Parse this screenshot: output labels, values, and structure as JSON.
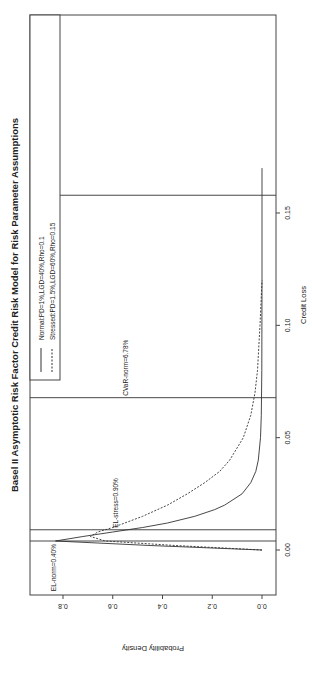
{
  "chart_data": {
    "type": "line",
    "title": "Basel II Asymptotic Risk Factor Credit Risk Model for Risk Parameter Assumptions",
    "xlabel": "Credit Loss",
    "ylabel": "Probability Density",
    "xlim": [
      -0.002,
      0.17
    ],
    "ylim": [
      0,
      0.86
    ],
    "x_ticks": [
      "0.00",
      "0.05",
      "0.10",
      "0.15"
    ],
    "y_ticks": [
      "0.0",
      "0.2",
      "0.4",
      "0.6",
      "0.8"
    ],
    "grid": false,
    "legend_position": "top-right",
    "rotation": "page rotated 90° counter-clockwise",
    "series": [
      {
        "name": "Normal:PD=1%,LGD=40%,Rho=0.1",
        "style": "solid",
        "x": [
          0.0,
          0.002,
          0.004,
          0.006,
          0.008,
          0.01,
          0.012,
          0.015,
          0.018,
          0.02,
          0.025,
          0.03,
          0.035,
          0.04,
          0.05,
          0.06,
          0.08,
          0.1,
          0.12,
          0.15,
          0.17
        ],
        "y": [
          0.0,
          0.45,
          0.83,
          0.72,
          0.6,
          0.48,
          0.38,
          0.27,
          0.19,
          0.15,
          0.08,
          0.045,
          0.025,
          0.015,
          0.006,
          0.003,
          0.001,
          0.0005,
          0.0002,
          0.0001,
          0.0
        ]
      },
      {
        "name": "Stressed:PD=1.5%,LGD=60%,Rho=0.15",
        "style": "dashed",
        "x": [
          0.0,
          0.002,
          0.004,
          0.006,
          0.008,
          0.01,
          0.015,
          0.02,
          0.025,
          0.03,
          0.035,
          0.04,
          0.05,
          0.06,
          0.07,
          0.08,
          0.1,
          0.12
        ],
        "y": [
          0.0,
          0.35,
          0.63,
          0.69,
          0.66,
          0.6,
          0.48,
          0.38,
          0.3,
          0.23,
          0.17,
          0.13,
          0.075,
          0.045,
          0.028,
          0.018,
          0.008,
          0.0
        ]
      }
    ],
    "vlines": [
      {
        "x": 0.004,
        "label": "EL-norm=0.40%"
      },
      {
        "x": 0.009,
        "label": "EL-stress=0.90%"
      },
      {
        "x": 0.0678,
        "label": "CVaR-norm=6.78%"
      },
      {
        "x": 0.1579,
        "label": "CVaR-stress=15.79%"
      }
    ]
  },
  "legend": {
    "items": [
      {
        "label": "Normal:PD=1%,LGD=40%,Rho=0.1",
        "style": "solid"
      },
      {
        "label": "Stressed:PD=1.5%,LGD=60%,Rho=0.15",
        "style": "dashed"
      }
    ]
  }
}
